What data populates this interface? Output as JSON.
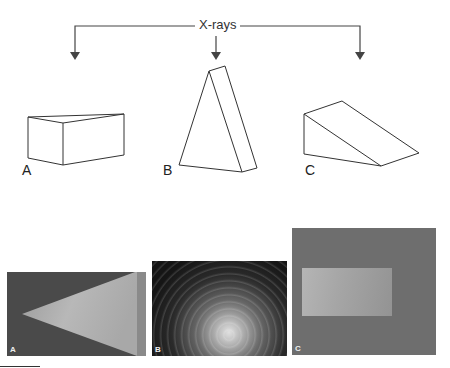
{
  "diagram": {
    "source_label": "X-rays",
    "shapes": [
      {
        "id": "A",
        "label": "A",
        "description": "rectangular wedge lying flat"
      },
      {
        "id": "B",
        "label": "B",
        "description": "triangular prism standing upright"
      },
      {
        "id": "C",
        "label": "C",
        "description": "ramp-shaped wedge"
      }
    ],
    "photos": [
      {
        "id": "A",
        "label": "A"
      },
      {
        "id": "B",
        "label": "B"
      },
      {
        "id": "C",
        "label": "C"
      }
    ]
  },
  "colors": {
    "line": "#333333",
    "background": "#ffffff"
  }
}
